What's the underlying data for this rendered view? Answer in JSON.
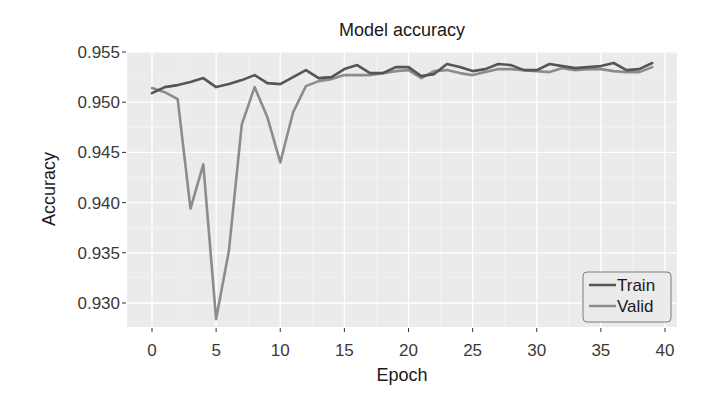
{
  "chart_data": {
    "type": "line",
    "title": "Model accuracy",
    "xlabel": "Epoch",
    "ylabel": "Accuracy",
    "xlim": [
      -1.9,
      40.5
    ],
    "ylim": [
      0.9273,
      0.955
    ],
    "x_ticks": [
      0,
      5,
      10,
      15,
      20,
      25,
      30,
      35,
      40
    ],
    "y_ticks": [
      0.93,
      0.935,
      0.94,
      0.945,
      0.95,
      0.955
    ],
    "y_tick_labels": [
      "0.930",
      "0.935",
      "0.940",
      "0.945",
      "0.950",
      "0.955"
    ],
    "grid": true,
    "legend_position": "bottom-right",
    "x": [
      0,
      1,
      2,
      3,
      4,
      5,
      6,
      7,
      8,
      9,
      10,
      11,
      12,
      13,
      14,
      15,
      16,
      17,
      18,
      19,
      20,
      21,
      22,
      23,
      24,
      25,
      26,
      27,
      28,
      29,
      30,
      31,
      32,
      33,
      34,
      35,
      36,
      37,
      38,
      39
    ],
    "series": [
      {
        "name": "Train",
        "color": "#555555",
        "values": [
          0.9509,
          0.9515,
          0.9517,
          0.952,
          0.9524,
          0.9515,
          0.9518,
          0.9522,
          0.9527,
          0.9519,
          0.9518,
          0.9525,
          0.9532,
          0.9524,
          0.9525,
          0.9533,
          0.9537,
          0.9529,
          0.9529,
          0.9535,
          0.9535,
          0.9526,
          0.9528,
          0.9538,
          0.9535,
          0.9531,
          0.9533,
          0.9538,
          0.9537,
          0.9532,
          0.9532,
          0.9538,
          0.9536,
          0.9534,
          0.9535,
          0.9536,
          0.9539,
          0.9532,
          0.9533,
          0.9539
        ]
      },
      {
        "name": "Valid",
        "color": "#8c8c8c",
        "values": [
          0.9514,
          0.951,
          0.9503,
          0.9394,
          0.9438,
          0.9284,
          0.9352,
          0.9478,
          0.9515,
          0.9485,
          0.944,
          0.949,
          0.9516,
          0.9521,
          0.9523,
          0.9527,
          0.9527,
          0.9527,
          0.9529,
          0.9531,
          0.9532,
          0.9524,
          0.9531,
          0.9532,
          0.9529,
          0.9527,
          0.953,
          0.9533,
          0.9533,
          0.9532,
          0.9531,
          0.953,
          0.9534,
          0.9532,
          0.9533,
          0.9533,
          0.9531,
          0.953,
          0.953,
          0.9535
        ]
      }
    ]
  },
  "legend": {
    "items": [
      {
        "label": "Train",
        "color": "#555555"
      },
      {
        "label": "Valid",
        "color": "#8c8c8c"
      }
    ]
  },
  "colors": {
    "panel_background": "#ebebeb",
    "grid_major": "#ffffff",
    "grid_minor": "#f5f5f5",
    "text": "#2b2b2b",
    "tick_text": "#4d4d4d"
  }
}
